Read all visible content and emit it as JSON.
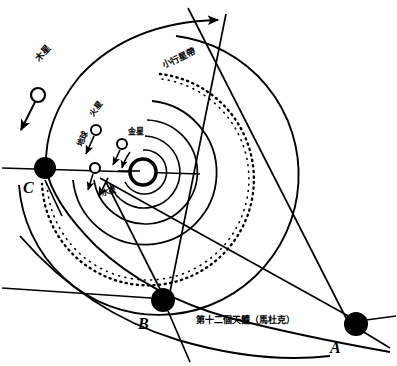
{
  "diagram": {
    "background_color": "#ffffff",
    "stroke_color": "#000000",
    "width": 397,
    "height": 366
  },
  "center": {
    "name": "sun",
    "x": 143,
    "y": 172,
    "radius": 13
  },
  "planets": [
    {
      "id": "jupiter",
      "label": "木星",
      "label_x": 34,
      "label_y": 57,
      "rotation": -47,
      "marker_x": 38,
      "marker_y": 95,
      "marker_r": 7,
      "font_size": 9
    },
    {
      "id": "mars",
      "label": "火星",
      "label_x": 88,
      "label_y": 113,
      "rotation": -52,
      "marker_x": 96,
      "marker_y": 130,
      "marker_r": 5,
      "font_size": 8
    },
    {
      "id": "venus",
      "label": "金星",
      "label_x": 128,
      "label_y": 128,
      "rotation": 0,
      "marker_x": 122,
      "marker_y": 144,
      "marker_r": 5,
      "font_size": 8
    },
    {
      "id": "earth",
      "label": "地球",
      "label_x": 76,
      "label_y": 145,
      "rotation": -68,
      "marker_x": 95,
      "marker_y": 168,
      "marker_r": 5,
      "font_size": 8
    },
    {
      "id": "mercury",
      "label": "水星",
      "label_x": 100,
      "label_y": 190,
      "rotation": -16,
      "marker_x": 0,
      "marker_y": 0,
      "marker_r": 0,
      "font_size": 8
    }
  ],
  "asteroid_belt": {
    "id": "asteroid-belt",
    "label": "小行星帶",
    "label_x": 161,
    "label_y": 62,
    "rotation": -25,
    "font_size": 9
  },
  "twelfth_body": {
    "id": "twelfth-planet",
    "label": "第十二個天體（馬杜克）",
    "label_x": 196,
    "label_y": 316,
    "font_size": 9
  },
  "nodes": [
    {
      "id": "A",
      "label": "A",
      "x": 356,
      "y": 324,
      "r": 12,
      "label_x": 330,
      "label_y": 340,
      "font_size": 16
    },
    {
      "id": "B",
      "label": "B",
      "x": 163,
      "y": 300,
      "r": 12,
      "label_x": 138,
      "label_y": 316,
      "font_size": 16
    },
    {
      "id": "C",
      "label": "C",
      "x": 45,
      "y": 168,
      "r": 11,
      "label_x": 23,
      "label_y": 180,
      "font_size": 16
    }
  ]
}
